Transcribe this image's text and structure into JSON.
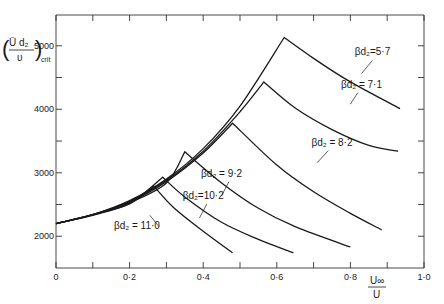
{
  "chart_data": {
    "type": "line",
    "title": "",
    "xlabel": "U∞ / U",
    "ylabel": "(Ū d₂ / υ)crit",
    "xlim": [
      0,
      1.0
    ],
    "ylim": [
      1500,
      5500
    ],
    "grid": false,
    "legend": "inline labels on curves",
    "x_ticks": [
      {
        "value": 0,
        "label": "0"
      },
      {
        "value": 0.2,
        "label": "0·2"
      },
      {
        "value": 0.4,
        "label": "0·4"
      },
      {
        "value": 0.6,
        "label": "0·6"
      },
      {
        "value": 0.8,
        "label": "0·8"
      },
      {
        "value": 1.0,
        "label": "1·0"
      }
    ],
    "x_minor_ticks": [
      0.1,
      0.3,
      0.5,
      0.7,
      0.9
    ],
    "y_ticks": [
      {
        "value": 2000,
        "label": "2000"
      },
      {
        "value": 3000,
        "label": "3000"
      },
      {
        "value": 4000,
        "label": "4000"
      },
      {
        "value": 5000,
        "label": "5000"
      }
    ],
    "y_minor_ticks": [
      2500,
      3500,
      4500
    ],
    "series": [
      {
        "name": "βd₂ = 5·7",
        "label": "βd₂=5·7",
        "x": [
          0,
          0.1,
          0.2,
          0.3,
          0.4,
          0.5,
          0.62,
          0.7,
          0.8,
          0.935
        ],
        "y": [
          2200,
          2340,
          2560,
          2900,
          3380,
          4050,
          5130,
          4800,
          4430,
          4010
        ]
      },
      {
        "name": "βd₂ = 7·1",
        "label": "βd₂ = 7·1",
        "x": [
          0,
          0.1,
          0.2,
          0.3,
          0.4,
          0.5,
          0.565,
          0.65,
          0.75,
          0.85,
          0.93
        ],
        "y": [
          2200,
          2340,
          2550,
          2880,
          3340,
          3960,
          4430,
          4020,
          3680,
          3430,
          3340
        ]
      },
      {
        "name": "βd₂ = 8·2",
        "label": "βd₂ = 8·2",
        "x": [
          0,
          0.1,
          0.2,
          0.3,
          0.4,
          0.48,
          0.6,
          0.7,
          0.8,
          0.885
        ],
        "y": [
          2200,
          2340,
          2540,
          2860,
          3310,
          3780,
          3120,
          2700,
          2360,
          2100
        ]
      },
      {
        "name": "βd₂ = 9·2",
        "label": "βd₂ = 9·2",
        "x": [
          0,
          0.1,
          0.2,
          0.3,
          0.35,
          0.45,
          0.55,
          0.65,
          0.8
        ],
        "y": [
          2200,
          2340,
          2530,
          2840,
          3330,
          2840,
          2440,
          2150,
          1830
        ]
      },
      {
        "name": "βd₂ = 10·2",
        "label": "βd₂=10·2",
        "x": [
          0,
          0.1,
          0.2,
          0.29,
          0.35,
          0.45,
          0.55,
          0.645
        ],
        "y": [
          2200,
          2340,
          2520,
          2930,
          2620,
          2220,
          1950,
          1740
        ]
      },
      {
        "name": "βd₂ = 11·0",
        "label": "βd₂ = 11·0",
        "x": [
          0,
          0.1,
          0.2,
          0.266,
          0.32,
          0.4,
          0.48
        ],
        "y": [
          2200,
          2330,
          2510,
          2790,
          2450,
          2080,
          1740
        ]
      }
    ],
    "annotations": [
      {
        "text": "βd₂=5·7",
        "x": 0.86,
        "y": 4850
      },
      {
        "text": "βd₂ = 7·1",
        "x": 0.83,
        "y": 4340
      },
      {
        "text": "βd₂ = 8·2",
        "x": 0.75,
        "y": 3420
      },
      {
        "text": "βd₂ = 9·2",
        "x": 0.45,
        "y": 2940
      },
      {
        "text": "βd₂=10·2",
        "x": 0.4,
        "y": 2590
      },
      {
        "text": "βd₂ = 11·0",
        "x": 0.22,
        "y": 2110
      }
    ]
  },
  "axes": {
    "x_title_num": "U∞",
    "x_title_den": "U",
    "y_title_num": "Ū d₂",
    "y_title_den": "υ",
    "y_title_sub": "crit"
  }
}
